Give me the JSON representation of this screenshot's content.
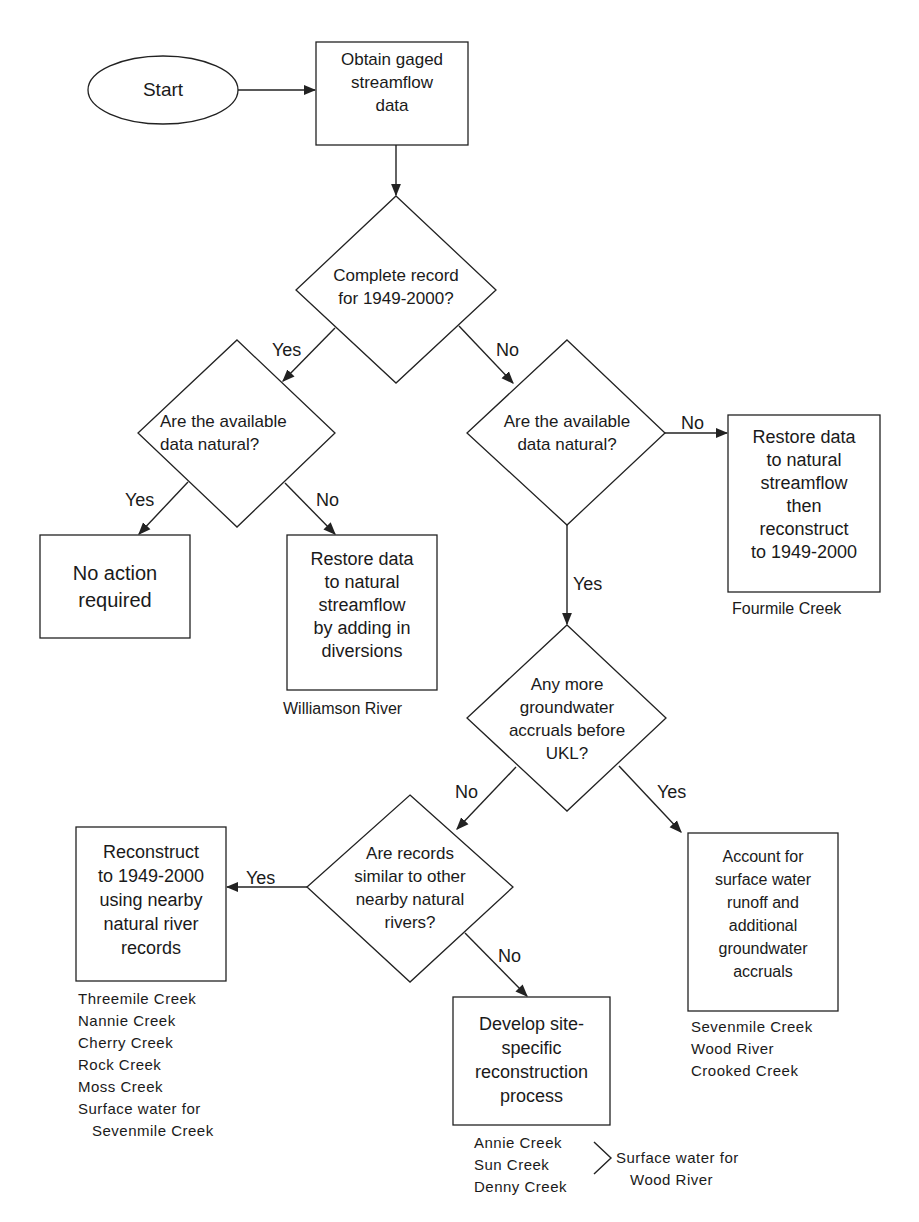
{
  "nodes": {
    "start": "Start",
    "obtain": "Obtain gaged\nstreamflow\ndata",
    "complete_record": "Complete record\nfor 1949-2000?",
    "natural_left": "Are the available\ndata natural?",
    "natural_right": "Are the available\ndata natural?",
    "no_action": "No action\nrequired",
    "restore_diversions": "Restore data\nto natural\nstreamflow\nby adding in\ndiversions",
    "restore_reconstruct": "Restore data\nto natural\nstreamflow\nthen\nreconstruct\nto 1949-2000",
    "groundwater": "Any more\ngroundwater\naccruals before\nUKL?",
    "similar_records": "Are records\nsimilar to other\nnearby natural\nrivers?",
    "reconstruct_nearby": "Reconstruct\nto 1949-2000\nusing nearby\nnatural river\nrecords",
    "develop_site": "Develop site-\nspecific\nreconstruction\nprocess",
    "account_surface": "Account for\nsurface water\nrunoff and\nadditional\ngroundwater\naccruals"
  },
  "edge_labels": {
    "complete_yes": "Yes",
    "complete_no": "No",
    "left_yes": "Yes",
    "left_no": "No",
    "right_no": "No",
    "right_yes": "Yes",
    "gw_no": "No",
    "gw_yes": "Yes",
    "similar_yes": "Yes",
    "similar_no": "No"
  },
  "notes": {
    "williamson": "Williamson River",
    "fourmile": "Fourmile Creek",
    "nearby_list": "Threemile Creek\nNannie Creek\nCherry Creek\nRock Creek\nMoss Creek\nSurface water for\n   Sevenmile Creek",
    "account_list": "Sevenmile Creek\nWood River\nCrooked Creek",
    "develop_list": "Annie Creek\nSun Creek\nDenny Creek",
    "develop_group": "Surface water for\n   Wood River"
  }
}
